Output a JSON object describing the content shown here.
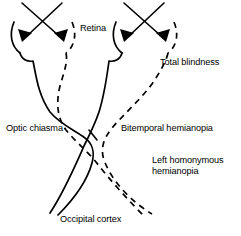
{
  "figure": {
    "background_color": "#ffffff",
    "stroke_color": "#000000"
  },
  "labels": {
    "retina": "Retina",
    "total_blindness": "Total blindness",
    "optic_chiasma": "Optic chiasma",
    "bitemporal_hemianopia": "Bitemporal hemianopia",
    "left_homonymous_line1": "Left homonymous",
    "left_homonymous_line2": "hemianopia",
    "occipital_cortex": "Occipital cortex"
  },
  "structures": {
    "left_eye": "left-retina-arc",
    "right_eye": "right-retina-arc",
    "solid_tract": "optic-nerve-solid",
    "dashed_tract": "optic-nerve-dashed",
    "chiasma_point": "optic-chiasma-crossing",
    "arrow_count": 4
  }
}
